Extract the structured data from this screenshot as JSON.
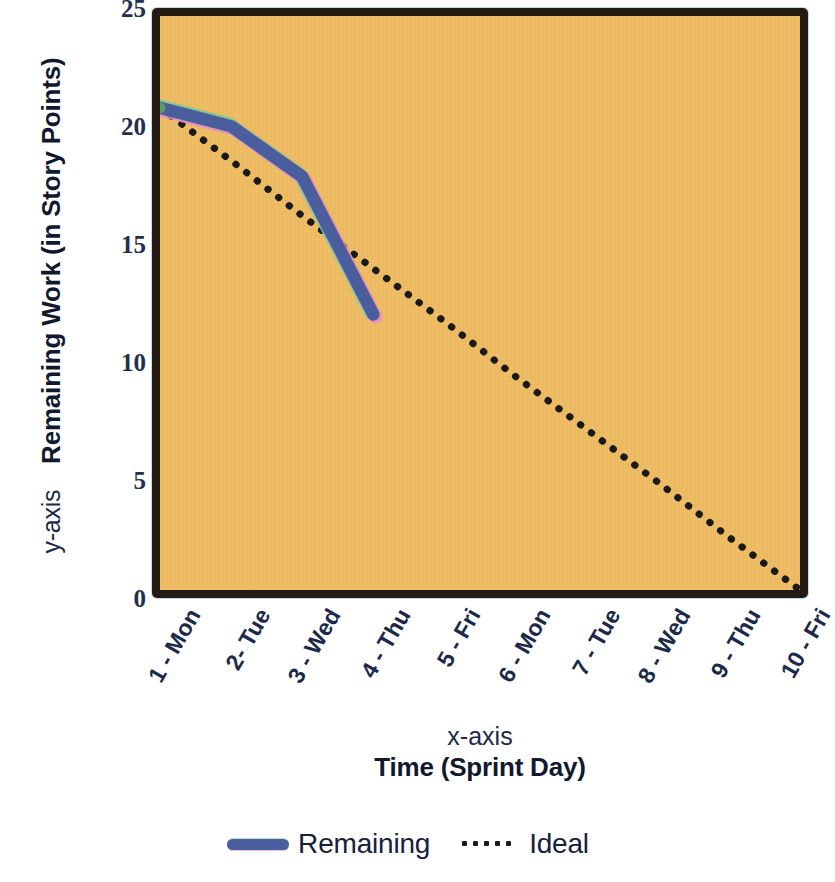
{
  "chart_data": {
    "type": "line",
    "title": "",
    "xlabel": "Time (Sprint Day)",
    "xlabel_prefix": "x-axis",
    "ylabel": "Remaining Work (in Story Points)",
    "ylabel_prefix": "y-axis",
    "categories": [
      "1 - Mon",
      "2- Tue",
      "3 - Wed",
      "4 - Thu",
      "5 - Fri",
      "6 - Mon",
      "7 - Tue",
      "8 - Wed",
      "9 - Thu",
      "10 - Fri"
    ],
    "x": [
      1,
      2,
      3,
      4,
      5,
      6,
      7,
      8,
      9,
      10
    ],
    "ylim": [
      0,
      25
    ],
    "xlim": [
      1,
      10
    ],
    "yticks": [
      25,
      20,
      15,
      10,
      5,
      0
    ],
    "grid": false,
    "legend_position": "bottom",
    "plot_background_color": "#F0BC5E",
    "plot_border_color": "#241C14",
    "series": [
      {
        "name": "Remaining",
        "color": "#4A5E9E",
        "style": "solid",
        "values": [
          21,
          20.2,
          18,
          12,
          null,
          null,
          null,
          null,
          null,
          null
        ]
      },
      {
        "name": "Ideal",
        "color": "#1A1A1A",
        "style": "dotted",
        "values": [
          21,
          18.7,
          16.3,
          14,
          11.7,
          9.3,
          7,
          4.7,
          2.3,
          0
        ]
      }
    ]
  },
  "legend": {
    "items": [
      {
        "label": "Remaining",
        "swatch": "solid-line-swatch"
      },
      {
        "label": "Ideal",
        "swatch": "dotted-line-swatch"
      }
    ]
  }
}
